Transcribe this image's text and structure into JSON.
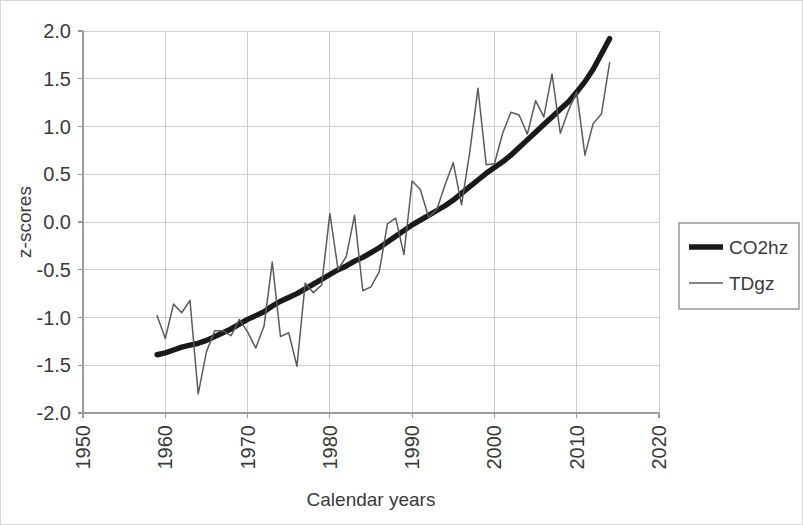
{
  "chart_data": {
    "type": "line",
    "title": "",
    "xlabel": "Calendar years",
    "ylabel": "z-scores",
    "xlim": [
      1950,
      2020
    ],
    "ylim": [
      -2.0,
      2.0
    ],
    "grid": true,
    "legend_position": "right",
    "x_ticks": [
      "1950",
      "1960",
      "1970",
      "1980",
      "1990",
      "2000",
      "2010",
      "2020"
    ],
    "x_tick_values": [
      1950,
      1960,
      1970,
      1980,
      1990,
      2000,
      2010,
      2020
    ],
    "y_ticks": [
      "-2.0",
      "-1.5",
      "-1.0",
      "-0.5",
      "0.0",
      "0.5",
      "1.0",
      "1.5",
      "2.0"
    ],
    "y_tick_values": [
      -2.0,
      -1.5,
      -1.0,
      -0.5,
      0.0,
      0.5,
      1.0,
      1.5,
      2.0
    ],
    "x": [
      1959,
      1960,
      1961,
      1962,
      1963,
      1964,
      1965,
      1966,
      1967,
      1968,
      1969,
      1970,
      1971,
      1972,
      1973,
      1974,
      1975,
      1976,
      1977,
      1978,
      1979,
      1980,
      1981,
      1982,
      1983,
      1984,
      1985,
      1986,
      1987,
      1988,
      1989,
      1990,
      1991,
      1992,
      1993,
      1994,
      1995,
      1996,
      1997,
      1998,
      1999,
      2000,
      2001,
      2002,
      2003,
      2004,
      2005,
      2006,
      2007,
      2008,
      2009,
      2010,
      2011,
      2012,
      2013,
      2014
    ],
    "series": [
      {
        "name": "CO2hz",
        "style": "thick",
        "color": "#1a1a1a",
        "values": [
          -1.39,
          -1.37,
          -1.34,
          -1.31,
          -1.29,
          -1.27,
          -1.24,
          -1.2,
          -1.16,
          -1.12,
          -1.07,
          -1.02,
          -0.98,
          -0.94,
          -0.88,
          -0.83,
          -0.79,
          -0.75,
          -0.7,
          -0.65,
          -0.6,
          -0.55,
          -0.5,
          -0.46,
          -0.41,
          -0.37,
          -0.32,
          -0.27,
          -0.21,
          -0.15,
          -0.09,
          -0.03,
          0.02,
          0.07,
          0.12,
          0.17,
          0.23,
          0.3,
          0.37,
          0.44,
          0.51,
          0.57,
          0.63,
          0.7,
          0.78,
          0.86,
          0.94,
          1.02,
          1.1,
          1.18,
          1.26,
          1.36,
          1.47,
          1.6,
          1.76,
          1.92
        ]
      },
      {
        "name": "TDgz",
        "style": "thin",
        "color": "#5b5b5b",
        "values": [
          -0.98,
          -1.22,
          -0.86,
          -0.95,
          -0.82,
          -1.8,
          -1.36,
          -1.14,
          -1.14,
          -1.19,
          -1.02,
          -1.15,
          -1.32,
          -1.09,
          -0.42,
          -1.2,
          -1.16,
          -1.51,
          -0.64,
          -0.74,
          -0.66,
          0.09,
          -0.5,
          -0.36,
          0.07,
          -0.72,
          -0.68,
          -0.52,
          -0.02,
          0.04,
          -0.34,
          0.43,
          0.34,
          0.05,
          0.13,
          0.39,
          0.62,
          0.18,
          0.73,
          1.4,
          0.6,
          0.61,
          0.93,
          1.15,
          1.12,
          0.92,
          1.27,
          1.1,
          1.55,
          0.93,
          1.17,
          1.36,
          0.7,
          1.03,
          1.13,
          1.67
        ]
      }
    ]
  },
  "axes": {
    "y_axis_title": "z-scores",
    "x_axis_title": "Calendar years"
  },
  "legend": {
    "entries": [
      {
        "label": "CO2hz",
        "style": "thick"
      },
      {
        "label": "TDgz",
        "style": "thin"
      }
    ]
  }
}
